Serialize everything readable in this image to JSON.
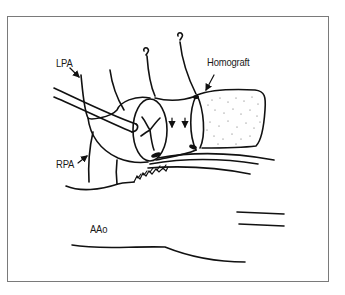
{
  "figure": {
    "labels": {
      "lpa": "LPA",
      "rpa": "RPA",
      "homograft": "Homograft",
      "aao": "AAo"
    },
    "colors": {
      "line": "#111111",
      "border": "#7a7a7a",
      "background": "#ffffff"
    }
  }
}
